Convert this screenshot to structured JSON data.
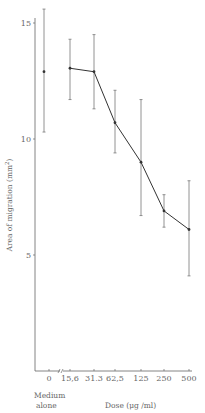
{
  "chart_data": {
    "type": "line",
    "title": "",
    "xlabel": "Dose (μg /ml)",
    "ylabel": "Area of migration (mm²)",
    "categories": [
      "0",
      "15,6",
      "31.3",
      "62,5",
      "125",
      "250",
      "500"
    ],
    "category_note": "Medium alone",
    "ylim": [
      0,
      15.8
    ],
    "yticks": [
      5,
      10,
      15
    ],
    "ytick_labels": [
      "5",
      "10",
      "15"
    ],
    "grid": false,
    "axis_break": "between 0 and 15,6",
    "series": [
      {
        "name": "Medium alone",
        "connected": false,
        "points": [
          {
            "category": "0",
            "mean": 12.9,
            "upper": 15.6,
            "lower": 10.3
          }
        ]
      },
      {
        "name": "Dose response",
        "connected": true,
        "points": [
          {
            "category": "15,6",
            "mean": 13.05,
            "upper": 14.3,
            "lower": 11.7
          },
          {
            "category": "31.3",
            "mean": 12.9,
            "upper": 14.5,
            "lower": 11.3
          },
          {
            "category": "62,5",
            "mean": 10.7,
            "upper": 12.1,
            "lower": 9.4
          },
          {
            "category": "125",
            "mean": 9.0,
            "upper": 11.7,
            "lower": 6.7
          },
          {
            "category": "250",
            "mean": 6.9,
            "upper": 7.6,
            "lower": 6.2
          },
          {
            "category": "500",
            "mean": 6.1,
            "upper": 8.2,
            "lower": 4.1
          }
        ]
      }
    ]
  },
  "labels": {
    "medium_line1": "Medium",
    "medium_line2": "alone",
    "xlabel": "Dose (μg /ml)",
    "ylabel_main": "Area of migration (mm",
    "ylabel_sup": "2",
    "ylabel_end": ")"
  },
  "colors": {
    "line": "#333333",
    "errorbar": "#777777",
    "axis": "#666666"
  }
}
